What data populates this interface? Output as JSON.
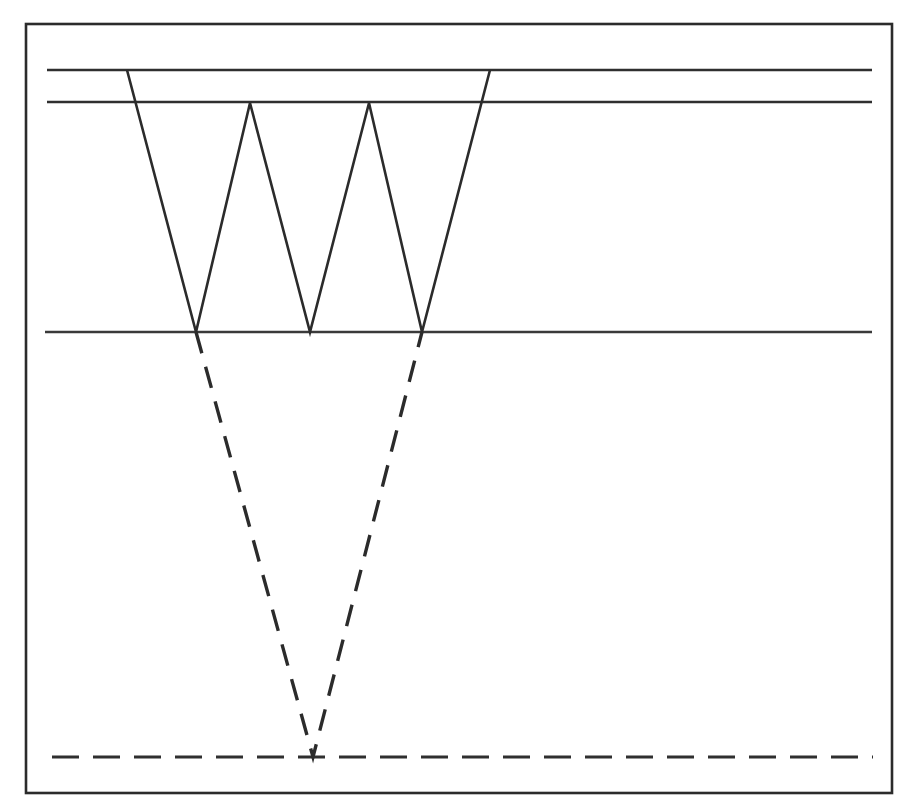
{
  "figure": {
    "canvas": {
      "width": 913,
      "height": 811
    },
    "background_color": "#ffffff",
    "ink_color": "#2b2b2b"
  },
  "frame": {
    "name": "outer-border",
    "x": 26,
    "y": 24,
    "width": 866,
    "height": 769,
    "stroke_width": 2.6,
    "color": "#2b2b2b"
  },
  "horizontal_lines": [
    {
      "id": "level-line-1",
      "style": "solid",
      "y": 70,
      "x_start": 47,
      "x_end": 872,
      "color": "#2f2f2f",
      "stroke_width": 2.6
    },
    {
      "id": "level-line-2",
      "style": "solid",
      "y": 102,
      "x_start": 47,
      "x_end": 872,
      "color": "#2f2f2f",
      "stroke_width": 2.6
    },
    {
      "id": "level-line-3",
      "style": "solid",
      "y": 332,
      "x_start": 45,
      "x_end": 872,
      "color": "#2f2f2f",
      "stroke_width": 2.6
    },
    {
      "id": "baseline-dashed",
      "style": "dashed",
      "y": 757,
      "x_start": 52,
      "x_end": 873,
      "color": "#2f2f2f",
      "stroke_width": 3.2,
      "dash_pattern": "27 14"
    }
  ],
  "zigzag": {
    "id": "solid-zigzag",
    "style": "solid",
    "color": "#2b2b2b",
    "stroke_width": 2.6,
    "points": [
      {
        "x": 127,
        "y": 70,
        "role": "start-on-level-1"
      },
      {
        "x": 196,
        "y": 332,
        "role": "valley-1-on-level-3"
      },
      {
        "x": 250,
        "y": 103,
        "role": "peak-1-on-level-2"
      },
      {
        "x": 310,
        "y": 332,
        "role": "valley-2-on-level-3"
      },
      {
        "x": 369,
        "y": 103,
        "role": "peak-2-on-level-2"
      },
      {
        "x": 422,
        "y": 332,
        "role": "valley-3-on-level-3"
      },
      {
        "x": 490,
        "y": 70,
        "role": "end-on-level-1"
      }
    ]
  },
  "dashed_v": {
    "id": "dashed-v",
    "style": "dashed",
    "color": "#2b2b2b",
    "stroke_width": 3.4,
    "dash_pattern": "22 14",
    "points": [
      {
        "x": 196,
        "y": 332,
        "role": "left-top-on-level-3"
      },
      {
        "x": 313,
        "y": 757,
        "role": "apex-on-baseline"
      },
      {
        "x": 422,
        "y": 332,
        "role": "right-top-on-level-3"
      }
    ]
  }
}
